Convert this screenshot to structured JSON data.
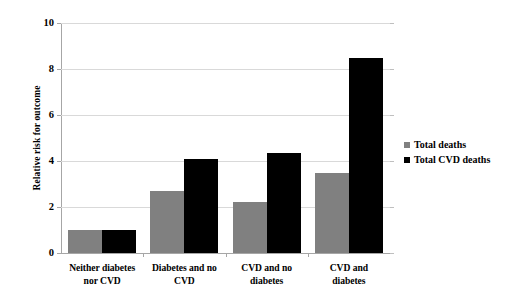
{
  "chart_data": {
    "type": "bar",
    "title": "",
    "subtitle": "",
    "xlabel": "",
    "ylabel": "Relative risk for outcome",
    "ylim": [
      0,
      10
    ],
    "y_ticks": [
      0,
      2,
      4,
      6,
      8,
      10
    ],
    "grid": true,
    "legend_position": "right",
    "categories": [
      "Neither diabetes nor CVD",
      "Diabetes and no CVD",
      "CVD and no diabetes",
      "CVD and diabetes"
    ],
    "category_labels": [
      {
        "line1": "Neither diabetes",
        "line2": "nor CVD"
      },
      {
        "line1": "Diabetes and no",
        "line2": "CVD"
      },
      {
        "line1": "CVD and no",
        "line2": "diabetes"
      },
      {
        "line1": "CVD and",
        "line2": "diabetes"
      }
    ],
    "series": [
      {
        "name": "Total deaths",
        "color": "#808080",
        "values": [
          1.0,
          2.7,
          2.2,
          3.5
        ]
      },
      {
        "name": "Total CVD deaths",
        "color": "#000000",
        "values": [
          1.0,
          4.1,
          4.35,
          8.5
        ]
      }
    ]
  },
  "axis": {
    "y_tick_labels": [
      "0",
      "2",
      "4",
      "6",
      "8",
      "10"
    ]
  },
  "legend": {
    "items": [
      {
        "label": "Total deaths"
      },
      {
        "label": "Total CVD deaths"
      }
    ]
  }
}
